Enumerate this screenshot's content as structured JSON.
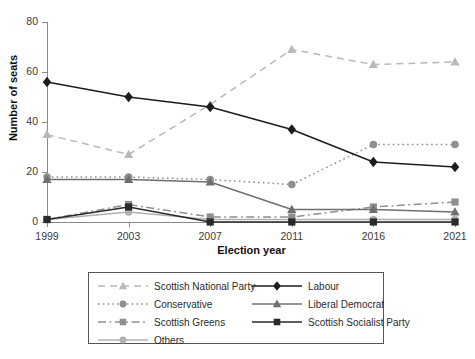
{
  "chart_data": {
    "type": "line",
    "title": "",
    "xlabel": "Election year",
    "ylabel": "Number of seats",
    "categories": [
      "1999",
      "2003",
      "2007",
      "2011",
      "2016",
      "2021"
    ],
    "x": [
      1999,
      2003,
      2007,
      2011,
      2016,
      2021
    ],
    "ylim": [
      0,
      80
    ],
    "yticks": [
      0,
      20,
      40,
      60,
      80
    ],
    "grid": false,
    "legend_position": "bottom",
    "series": [
      {
        "name": "Scottish National Party",
        "values": [
          35,
          27,
          47,
          69,
          63,
          64
        ],
        "color": "#b9b9b9",
        "dash": "dashed",
        "marker": "triangle"
      },
      {
        "name": "Conservative",
        "values": [
          18,
          18,
          17,
          15,
          31,
          31
        ],
        "color": "#8f8f8f",
        "dash": "dotted",
        "marker": "circle"
      },
      {
        "name": "Scottish Greens",
        "values": [
          1,
          7,
          2,
          2,
          6,
          8
        ],
        "color": "#8f8f8f",
        "dash": "dashdot",
        "marker": "square"
      },
      {
        "name": "Others",
        "values": [
          1,
          4,
          1,
          1,
          1,
          1
        ],
        "color": "#b0b0b0",
        "dash": "solid",
        "marker": "circle"
      },
      {
        "name": "Labour",
        "values": [
          56,
          50,
          46,
          37,
          24,
          22
        ],
        "color": "#1c1c1c",
        "dash": "solid",
        "marker": "diamond"
      },
      {
        "name": "Liberal Democrat",
        "values": [
          17,
          17,
          16,
          5,
          5,
          4
        ],
        "color": "#6f6f6f",
        "dash": "solid",
        "marker": "triangle"
      },
      {
        "name": "Scottish Socialist Party",
        "values": [
          1,
          6,
          0,
          0,
          0,
          0
        ],
        "color": "#2a2a2a",
        "dash": "solid",
        "marker": "square"
      }
    ]
  },
  "legend": {
    "columns": [
      [
        "Scottish National Party",
        "Conservative",
        "Scottish Greens",
        "Others"
      ],
      [
        "Labour",
        "Liberal Democrat",
        "Scottish Socialist Party"
      ]
    ]
  }
}
